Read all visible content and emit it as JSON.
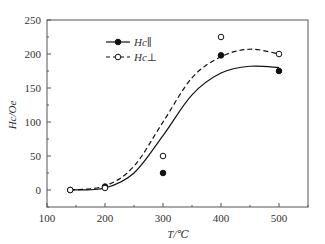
{
  "chart_data": {
    "type": "line",
    "title": "",
    "xlabel": "T/℃",
    "ylabel": "Hc/Oe",
    "xlim": [
      100,
      550
    ],
    "ylim": [
      -25,
      250
    ],
    "xticks": [
      100,
      200,
      300,
      400,
      500
    ],
    "yticks": [
      0,
      50,
      100,
      150,
      200,
      250
    ],
    "grid": false,
    "legend_position": "upper left",
    "series": [
      {
        "name": "Hc∥",
        "marker": "filled-circle",
        "line": "solid",
        "points": [
          [
            140,
            0
          ],
          [
            200,
            5
          ],
          [
            300,
            25
          ],
          [
            400,
            198
          ],
          [
            500,
            175
          ]
        ],
        "fit_curve": [
          [
            140,
            0
          ],
          [
            200,
            3
          ],
          [
            250,
            25
          ],
          [
            300,
            80
          ],
          [
            350,
            140
          ],
          [
            400,
            172
          ],
          [
            450,
            182
          ],
          [
            500,
            180
          ]
        ]
      },
      {
        "name": "Hc⊥",
        "marker": "open-circle",
        "line": "dashed",
        "points": [
          [
            140,
            0
          ],
          [
            200,
            3
          ],
          [
            300,
            50
          ],
          [
            400,
            225
          ],
          [
            500,
            200
          ]
        ],
        "fit_curve": [
          [
            140,
            0
          ],
          [
            200,
            6
          ],
          [
            250,
            35
          ],
          [
            300,
            100
          ],
          [
            350,
            165
          ],
          [
            400,
            196
          ],
          [
            450,
            207
          ],
          [
            500,
            200
          ]
        ]
      }
    ]
  }
}
